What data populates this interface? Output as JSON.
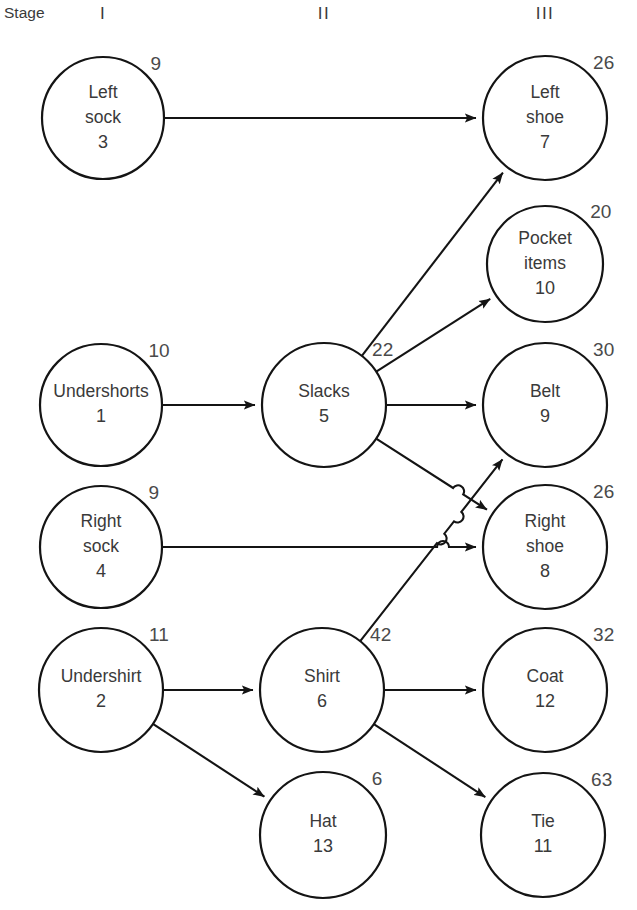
{
  "diagram": {
    "stage_word": "Stage",
    "stages": [
      {
        "roman": "I",
        "x": 103
      },
      {
        "roman": "II",
        "x": 324
      },
      {
        "roman": "III",
        "x": 545
      }
    ],
    "nodes": [
      {
        "id": "left-sock",
        "lines": [
          "Left",
          "sock"
        ],
        "number": "3",
        "corner": "9",
        "cx": 103,
        "cy": 118,
        "r": 61
      },
      {
        "id": "left-shoe",
        "lines": [
          "Left",
          "shoe"
        ],
        "number": "7",
        "corner": "26",
        "cx": 545,
        "cy": 118,
        "r": 62
      },
      {
        "id": "pocket-items",
        "lines": [
          "Pocket",
          "items"
        ],
        "number": "10",
        "corner": "20",
        "cx": 545,
        "cy": 264,
        "r": 58
      },
      {
        "id": "undershorts",
        "lines": [
          "Undershorts"
        ],
        "number": "1",
        "corner": "10",
        "cx": 101,
        "cy": 405,
        "r": 61
      },
      {
        "id": "slacks",
        "lines": [
          "Slacks"
        ],
        "number": "5",
        "corner": "22",
        "cx": 324,
        "cy": 405,
        "r": 62
      },
      {
        "id": "belt",
        "lines": [
          "Belt"
        ],
        "number": "9",
        "corner": "30",
        "cx": 545,
        "cy": 405,
        "r": 62
      },
      {
        "id": "right-sock",
        "lines": [
          "Right",
          "sock"
        ],
        "number": "4",
        "corner": "9",
        "cx": 101,
        "cy": 547,
        "r": 61
      },
      {
        "id": "right-shoe",
        "lines": [
          "Right",
          "shoe"
        ],
        "number": "8",
        "corner": "26",
        "cx": 545,
        "cy": 547,
        "r": 62
      },
      {
        "id": "undershirt",
        "lines": [
          "Undershirt"
        ],
        "number": "2",
        "corner": "11",
        "cx": 101,
        "cy": 690,
        "r": 62
      },
      {
        "id": "shirt",
        "lines": [
          "Shirt"
        ],
        "number": "6",
        "corner": "42",
        "cx": 322,
        "cy": 690,
        "r": 62
      },
      {
        "id": "coat",
        "lines": [
          "Coat"
        ],
        "number": "12",
        "corner": "32",
        "cx": 545,
        "cy": 690,
        "r": 62
      },
      {
        "id": "hat",
        "lines": [
          "Hat"
        ],
        "number": "13",
        "corner": "6",
        "cx": 323,
        "cy": 835,
        "r": 63
      },
      {
        "id": "tie",
        "lines": [
          "Tie"
        ],
        "number": "11",
        "corner": "63",
        "cx": 543,
        "cy": 835,
        "r": 62
      }
    ],
    "edges": [
      {
        "from": "left-sock",
        "to": "left-shoe"
      },
      {
        "from": "undershorts",
        "to": "slacks"
      },
      {
        "from": "slacks",
        "to": "left-shoe"
      },
      {
        "from": "slacks",
        "to": "pocket-items"
      },
      {
        "from": "slacks",
        "to": "belt"
      },
      {
        "from": "slacks",
        "to": "right-shoe"
      },
      {
        "from": "right-sock",
        "to": "right-shoe"
      },
      {
        "from": "undershirt",
        "to": "shirt"
      },
      {
        "from": "undershirt",
        "to": "hat"
      },
      {
        "from": "shirt",
        "to": "belt"
      },
      {
        "from": "shirt",
        "to": "coat"
      },
      {
        "from": "shirt",
        "to": "tie"
      }
    ]
  }
}
